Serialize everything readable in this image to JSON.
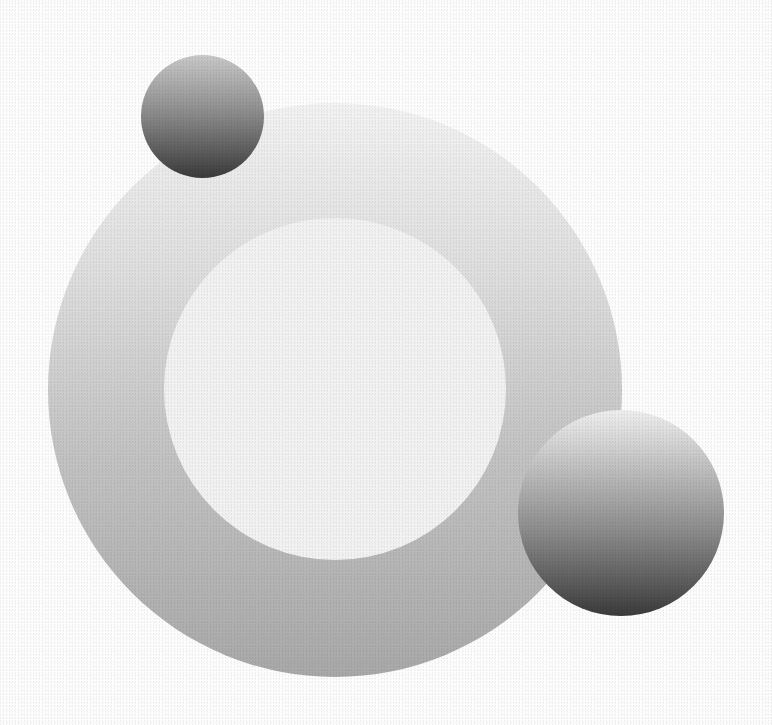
{
  "image": {
    "description": "Abstract grayscale composition of concentric circles and two gradient spheres",
    "width": 772,
    "height": 725,
    "background_color": "#ffffff"
  },
  "shapes": [
    {
      "name": "outer-ring",
      "type": "circle",
      "center": [
        335,
        390
      ],
      "radius": 287,
      "fill": "vertical gradient",
      "colors": [
        "#f3f3f3",
        "#a9a9a9"
      ]
    },
    {
      "name": "inner-disc",
      "type": "circle",
      "center": [
        335,
        389
      ],
      "radius": 171,
      "fill": "solid",
      "colors": [
        "#f2f2f2"
      ]
    },
    {
      "name": "sphere-small",
      "type": "sphere",
      "center": [
        202,
        116
      ],
      "radius": 61,
      "fill": "vertical gradient",
      "colors": [
        "#c9c9c9",
        "#3a3a3a"
      ]
    },
    {
      "name": "sphere-large",
      "type": "sphere",
      "center": [
        620,
        513
      ],
      "radius": 103,
      "fill": "vertical gradient",
      "colors": [
        "#efefef",
        "#3a3a3a"
      ]
    }
  ]
}
